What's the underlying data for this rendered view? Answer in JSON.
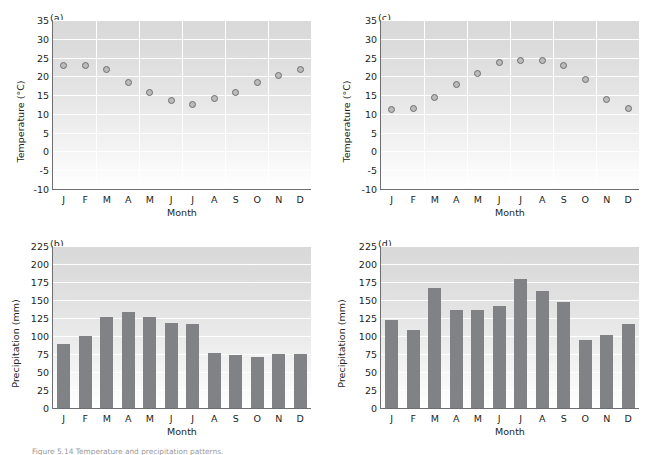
{
  "figure": {
    "caption": "Figure 5.14 Temperature and precipitation patterns.",
    "months": [
      "J",
      "F",
      "M",
      "A",
      "M",
      "J",
      "J",
      "A",
      "S",
      "O",
      "N",
      "D"
    ]
  },
  "chart_data": [
    {
      "type": "scatter",
      "panel": "(a)",
      "title": "",
      "xlabel": "Month",
      "ylabel": "Temperature (°C)",
      "categories": [
        "J",
        "F",
        "M",
        "A",
        "M",
        "J",
        "J",
        "A",
        "S",
        "O",
        "N",
        "D"
      ],
      "values": [
        22.8,
        23.0,
        21.7,
        18.3,
        15.6,
        13.5,
        12.4,
        14.2,
        15.6,
        18.4,
        20.2,
        21.9
      ],
      "ylim": [
        -10,
        35
      ],
      "yticks": [
        -10,
        -5,
        0,
        5,
        10,
        15,
        20,
        25,
        30,
        35
      ],
      "ytick_labels": [
        "-10",
        "-5",
        "0",
        "5",
        "10",
        "15",
        "20",
        "25",
        "30",
        "35"
      ],
      "grid": true,
      "legend": "none"
    },
    {
      "type": "bar",
      "panel": "(b)",
      "title": "",
      "xlabel": "Month",
      "ylabel": "Precipitation (mm)",
      "categories": [
        "J",
        "F",
        "M",
        "A",
        "M",
        "J",
        "J",
        "A",
        "S",
        "O",
        "N",
        "D"
      ],
      "values": [
        89,
        100,
        126,
        134,
        126,
        118,
        117,
        76,
        74,
        71,
        75,
        75
      ],
      "ylim": [
        0,
        225
      ],
      "yticks": [
        0,
        25,
        50,
        75,
        100,
        125,
        150,
        175,
        200,
        225
      ],
      "ytick_labels": [
        "0",
        "25",
        "50",
        "75",
        "100",
        "125",
        "150",
        "175",
        "200",
        "225"
      ],
      "grid": true,
      "legend": "none"
    },
    {
      "type": "scatter",
      "panel": "(c)",
      "title": "",
      "xlabel": "Month",
      "ylabel": "Temperature (°C)",
      "categories": [
        "J",
        "F",
        "M",
        "A",
        "M",
        "J",
        "J",
        "A",
        "S",
        "O",
        "N",
        "D"
      ],
      "values": [
        11.1,
        11.4,
        14.3,
        17.7,
        20.8,
        23.8,
        24.1,
        24.2,
        22.8,
        19.1,
        13.9,
        11.4
      ],
      "ylim": [
        -10,
        35
      ],
      "yticks": [
        -10,
        -5,
        0,
        5,
        10,
        15,
        20,
        25,
        30,
        35
      ],
      "ytick_labels": [
        "-10",
        "-5",
        "0",
        "5",
        "10",
        "15",
        "20",
        "25",
        "30",
        "35"
      ],
      "grid": true,
      "legend": "none"
    },
    {
      "type": "bar",
      "panel": "(d)",
      "title": "",
      "xlabel": "Month",
      "ylabel": "Precipitation (mm)",
      "categories": [
        "J",
        "F",
        "M",
        "A",
        "M",
        "J",
        "J",
        "A",
        "S",
        "O",
        "N",
        "D"
      ],
      "values": [
        122,
        108,
        167,
        136,
        136,
        142,
        179,
        163,
        147,
        94,
        101,
        117
      ],
      "ylim": [
        0,
        225
      ],
      "yticks": [
        0,
        25,
        50,
        75,
        100,
        125,
        150,
        175,
        200,
        225
      ],
      "ytick_labels": [
        "0",
        "25",
        "50",
        "75",
        "100",
        "125",
        "150",
        "175",
        "200",
        "225"
      ],
      "grid": true,
      "legend": "none"
    }
  ]
}
